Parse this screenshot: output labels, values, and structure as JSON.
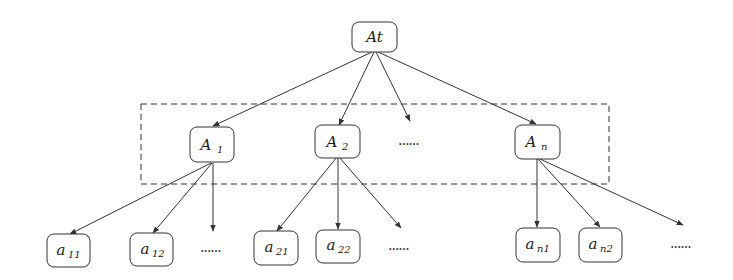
{
  "diagram": {
    "root": {
      "label": "At"
    },
    "level1": [
      {
        "base": "A",
        "sub": "1"
      },
      {
        "base": "A",
        "sub": "2"
      },
      {
        "base": "A",
        "sub": "n"
      }
    ],
    "level1_ellipsis": "......",
    "level2": [
      {
        "base": "a",
        "sub": "11"
      },
      {
        "base": "a",
        "sub": "12"
      },
      {
        "base": "a",
        "sub": "21"
      },
      {
        "base": "a",
        "sub": "22"
      },
      {
        "base": "a",
        "sub": "n1"
      },
      {
        "base": "a",
        "sub": "n2"
      }
    ],
    "level2_ellipsis": [
      "......",
      "......",
      "......"
    ],
    "colors": {
      "stroke": "#333333",
      "background": "#ffffff",
      "dashed_box": "#333333"
    }
  }
}
